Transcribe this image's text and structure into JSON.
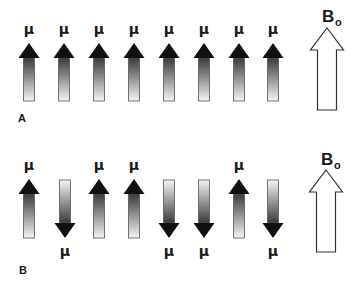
{
  "figure": {
    "width": 358,
    "height": 282,
    "colors": {
      "arrow_head": "#111111",
      "shaft_dark": "#3a3a3a",
      "shaft_light": "#f4f4f4",
      "shaft_border": "#555555",
      "field_arrow_fill": "#ffffff",
      "field_arrow_stroke": "#333333"
    },
    "spin_symbol": "μ",
    "field_label": "B",
    "field_subscript": "o"
  },
  "panels": [
    {
      "label": "A",
      "label_x": 18,
      "label_y": 122,
      "description": "All magnetic moments aligned parallel to B0",
      "arrow_top": 43,
      "arrow_bottom": 101,
      "spins": [
        {
          "x": 29,
          "direction": "up"
        },
        {
          "x": 64,
          "direction": "up"
        },
        {
          "x": 99,
          "direction": "up"
        },
        {
          "x": 134,
          "direction": "up"
        },
        {
          "x": 169,
          "direction": "up"
        },
        {
          "x": 204,
          "direction": "up"
        },
        {
          "x": 239,
          "direction": "up"
        },
        {
          "x": 273,
          "direction": "up"
        }
      ],
      "field_arrow": {
        "x": 327,
        "top": 28,
        "bottom": 110,
        "label_y": 22
      }
    },
    {
      "label": "B",
      "label_x": 19,
      "label_y": 274,
      "description": "Magnetic moments aligned parallel and antiparallel to B0",
      "arrow_top": 179,
      "arrow_bottom": 238,
      "spins": [
        {
          "x": 29,
          "direction": "up"
        },
        {
          "x": 65,
          "direction": "down"
        },
        {
          "x": 99,
          "direction": "up"
        },
        {
          "x": 134,
          "direction": "up"
        },
        {
          "x": 169,
          "direction": "down"
        },
        {
          "x": 204,
          "direction": "down"
        },
        {
          "x": 239,
          "direction": "up"
        },
        {
          "x": 273,
          "direction": "down"
        }
      ],
      "field_arrow": {
        "x": 326,
        "top": 170,
        "bottom": 252,
        "label_y": 165
      }
    }
  ]
}
